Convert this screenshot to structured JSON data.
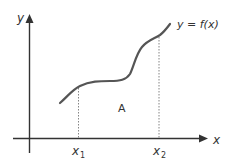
{
  "diagram": {
    "function_label": "y = f(x)",
    "y_axis_label": "y",
    "x_axis_label": "x",
    "area_label": "A",
    "x1_label": "x",
    "x1_sub": "1",
    "x2_label": "x",
    "x2_sub": "2",
    "colors": {
      "axis": "#333333",
      "curve": "#555555",
      "dotted": "#777777"
    }
  }
}
